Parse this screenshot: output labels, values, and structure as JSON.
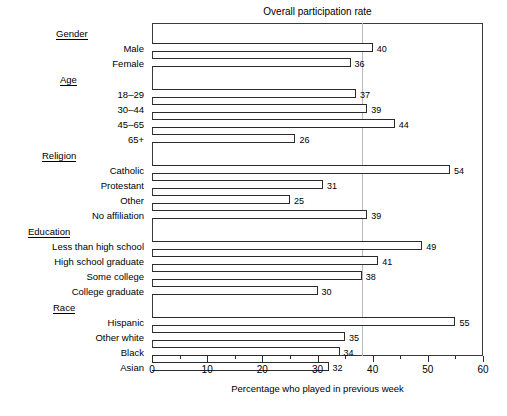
{
  "chart_data": {
    "type": "bar",
    "orientation": "horizontal",
    "title": "Overall participation rate",
    "xlabel": "Percentage who played in previous week",
    "ylabel": "",
    "xlim": [
      0,
      60
    ],
    "xticks": [
      0,
      10,
      20,
      30,
      40,
      50,
      60
    ],
    "xtick_labels": [
      "0",
      "10",
      "20",
      "30",
      "40",
      "50",
      "60"
    ],
    "minor_ticks": [
      5,
      15,
      25,
      35,
      45,
      55
    ],
    "grid": false,
    "legend": null,
    "reference_line": {
      "value": 38,
      "label": "Overall participation rate",
      "style": "solid-light"
    },
    "groups": [
      {
        "name": "Gender",
        "categories": [
          "Male",
          "Female"
        ],
        "values": [
          40,
          36
        ]
      },
      {
        "name": "Age",
        "categories": [
          "18–29",
          "30–44",
          "45–65",
          "65+"
        ],
        "values": [
          37,
          39,
          44,
          26
        ]
      },
      {
        "name": "Religion",
        "categories": [
          "Catholic",
          "Protestant",
          "Other",
          "No affiliation"
        ],
        "values": [
          54,
          31,
          25,
          39
        ]
      },
      {
        "name": "Education",
        "categories": [
          "Less than high school",
          "High school graduate",
          "Some college",
          "College graduate"
        ],
        "values": [
          49,
          41,
          38,
          30
        ]
      },
      {
        "name": "Race",
        "categories": [
          "Hispanic",
          "Other white",
          "Black",
          "Asian"
        ],
        "values": [
          55,
          35,
          34,
          32
        ]
      }
    ],
    "categories": [
      "Male",
      "Female",
      "18–29",
      "30–44",
      "45–65",
      "65+",
      "Catholic",
      "Protestant",
      "Other",
      "No affiliation",
      "Less than high school",
      "High school graduate",
      "Some college",
      "College graduate",
      "Hispanic",
      "Other white",
      "Black",
      "Asian"
    ],
    "values": [
      40,
      36,
      37,
      39,
      44,
      26,
      54,
      31,
      25,
      39,
      49,
      41,
      38,
      30,
      55,
      35,
      34,
      32
    ],
    "colors": {
      "bar_fill": "#ffffff",
      "bar_outline": "#2b2b2b",
      "frame": "#3a3a3a",
      "reference_line": "#b8b8b8",
      "text": "#000000"
    }
  }
}
